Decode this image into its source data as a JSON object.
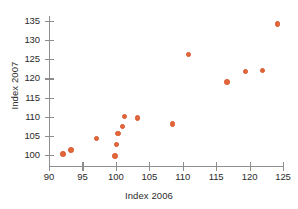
{
  "chart_data": {
    "type": "scatter",
    "title": "",
    "xlabel": "Index 2006",
    "ylabel": "Index 2007",
    "xlim": [
      90,
      125
    ],
    "ylim": [
      98,
      136
    ],
    "xticks": [
      90,
      95,
      100,
      105,
      110,
      115,
      120,
      125
    ],
    "yticks": [
      100,
      105,
      110,
      115,
      120,
      125,
      130,
      135
    ],
    "grid": false,
    "legend": false,
    "marker_color": "#e2683c",
    "axis_color": "#8d8d8d",
    "points": [
      {
        "x": 92.1,
        "y": 100.2
      },
      {
        "x": 93.3,
        "y": 101.3
      },
      {
        "x": 97.1,
        "y": 104.3
      },
      {
        "x": 99.9,
        "y": 99.8
      },
      {
        "x": 100.1,
        "y": 102.8
      },
      {
        "x": 100.3,
        "y": 105.6
      },
      {
        "x": 101.0,
        "y": 107.4
      },
      {
        "x": 101.3,
        "y": 110.0
      },
      {
        "x": 103.2,
        "y": 109.6
      },
      {
        "x": 108.5,
        "y": 108.1
      },
      {
        "x": 110.9,
        "y": 126.2
      },
      {
        "x": 116.6,
        "y": 119.1
      },
      {
        "x": 119.4,
        "y": 121.8
      },
      {
        "x": 121.9,
        "y": 122.1
      },
      {
        "x": 124.2,
        "y": 134.2
      }
    ]
  }
}
